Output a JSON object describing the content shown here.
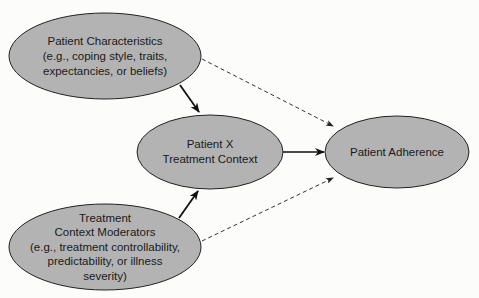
{
  "diagram": {
    "colors": {
      "node_fill": "#b3b3b3",
      "node_stroke": "#222222",
      "edge": "#111111",
      "background": "#fcfcfb"
    },
    "nodes": [
      {
        "id": "patient_characteristics",
        "lines": [
          "Patient Characteristics",
          "(e.g., coping style, traits,",
          "expectancies, or beliefs)"
        ]
      },
      {
        "id": "patient_x_treatment_context",
        "lines": [
          "Patient X",
          "Treatment Context"
        ]
      },
      {
        "id": "patient_adherence",
        "lines": [
          "Patient Adherence"
        ]
      },
      {
        "id": "treatment_context_moderators",
        "lines": [
          "Treatment",
          "Context Moderators",
          "(e.g., treatment controllability,",
          "predictability, or illness",
          "severity)"
        ]
      }
    ],
    "edges": [
      {
        "from": "patient_characteristics",
        "to": "patient_x_treatment_context",
        "style": "solid"
      },
      {
        "from": "treatment_context_moderators",
        "to": "patient_x_treatment_context",
        "style": "solid"
      },
      {
        "from": "patient_x_treatment_context",
        "to": "patient_adherence",
        "style": "solid"
      },
      {
        "from": "patient_characteristics",
        "to": "patient_adherence",
        "style": "dashed"
      },
      {
        "from": "treatment_context_moderators",
        "to": "patient_adherence",
        "style": "dashed"
      }
    ]
  }
}
